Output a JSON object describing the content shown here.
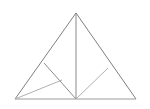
{
  "figure": {
    "background_color": "#ffffff",
    "canvas": {
      "width": 150,
      "height": 109
    },
    "stroke_colors": {
      "outline": "#7f7f7f",
      "median": "#8a8a8a",
      "cevian_dark": "#8c8c8c",
      "cevian_light": "#b0b0b0",
      "base": "#9a9a9a"
    },
    "stroke_widths": {
      "outline": 1,
      "median": 1,
      "cevian_dark": 1,
      "cevian_light": 1,
      "base": 1
    },
    "points": {
      "apex": {
        "name": "A",
        "x": 76,
        "y": 13
      },
      "bottom_left": {
        "name": "B",
        "x": 15,
        "y": 99
      },
      "bottom_right": {
        "name": "C",
        "x": 136,
        "y": 99
      },
      "base_midpoint": {
        "name": "M",
        "x": 76,
        "y": 99
      },
      "left_edge_point": {
        "name": "L",
        "x": 44,
        "y": 63
      },
      "right_edge_point": {
        "name": "R",
        "x": 108,
        "y": 68
      },
      "left_interior_point": {
        "name": "P",
        "x": 62,
        "y": 80
      }
    },
    "segments": [
      {
        "name": "left-outline",
        "from": "apex",
        "to": "bottom_left",
        "color_key": "outline"
      },
      {
        "name": "right-outline",
        "from": "apex",
        "to": "bottom_right",
        "color_key": "outline"
      },
      {
        "name": "base-outline",
        "from": "bottom_left",
        "to": "bottom_right",
        "color_key": "base"
      },
      {
        "name": "vertical-median",
        "from": "apex",
        "to": "base_midpoint",
        "color_key": "median"
      },
      {
        "name": "left-cevian",
        "from": "left_edge_point",
        "to": "base_midpoint",
        "color_key": "cevian_dark"
      },
      {
        "name": "left-light-cevian",
        "from": "bottom_left",
        "to": "left_interior_point",
        "color_key": "cevian_light"
      },
      {
        "name": "right-light-cevian",
        "from": "base_midpoint",
        "to": "right_edge_point",
        "color_key": "cevian_light"
      }
    ]
  }
}
